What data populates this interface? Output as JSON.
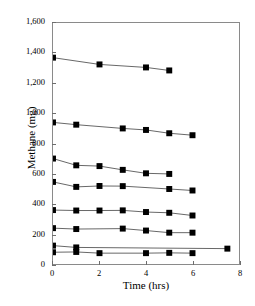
{
  "chart_data": {
    "type": "line",
    "title": "",
    "xlabel": "Time (hrs)",
    "ylabel": "Methane (mg)",
    "xlim": [
      0,
      8
    ],
    "ylim": [
      0,
      1600
    ],
    "xticks": [
      0,
      2,
      4,
      6,
      8
    ],
    "xtick_labels": [
      "0",
      "2",
      "4",
      "6",
      "8"
    ],
    "yticks": [
      0,
      200,
      400,
      600,
      800,
      1000,
      1200,
      1400,
      1600
    ],
    "ytick_labels": [
      "0",
      "200",
      "400",
      "600",
      "800",
      "1,000",
      "1,200",
      "1,400",
      "1,600"
    ],
    "grid": false,
    "legend": "none",
    "marker": "filled-square",
    "marker_color": "#000000",
    "line_color": "#555555",
    "axis_color": "#8a8a8a",
    "background": "#ffffff",
    "series": [
      {
        "name": "series-1",
        "x": [
          0,
          2,
          4,
          5
        ],
        "values": [
          1370,
          1325,
          1305,
          1285
        ]
      },
      {
        "name": "series-2",
        "x": [
          0,
          1,
          3,
          4,
          5,
          6
        ],
        "values": [
          940,
          925,
          900,
          890,
          868,
          855
        ]
      },
      {
        "name": "series-3",
        "x": [
          0,
          1,
          2,
          3,
          4,
          5
        ],
        "values": [
          700,
          655,
          650,
          625,
          602,
          598
        ]
      },
      {
        "name": "series-4",
        "x": [
          0,
          1,
          2,
          3,
          5,
          6
        ],
        "values": [
          545,
          512,
          518,
          517,
          498,
          488
        ]
      },
      {
        "name": "series-5",
        "x": [
          0,
          1,
          2,
          3,
          4,
          5,
          6
        ],
        "values": [
          358,
          355,
          355,
          356,
          345,
          340,
          322
        ]
      },
      {
        "name": "series-6",
        "x": [
          0,
          1,
          3,
          4,
          5,
          6
        ],
        "values": [
          238,
          232,
          235,
          222,
          208,
          208
        ]
      },
      {
        "name": "series-7",
        "x": [
          0,
          1,
          7.5
        ],
        "values": [
          122,
          110,
          102
        ]
      },
      {
        "name": "series-8",
        "x": [
          0,
          1,
          2,
          4,
          5,
          6
        ],
        "values": [
          78,
          80,
          72,
          72,
          74,
          72
        ]
      }
    ]
  }
}
